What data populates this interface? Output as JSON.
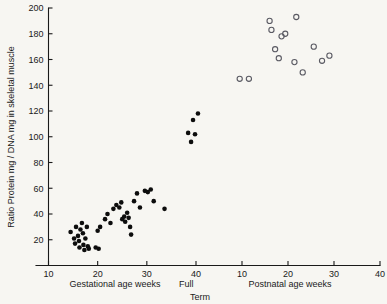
{
  "chart_data": {
    "type": "scatter",
    "title": "",
    "ylabel": "Ratio Protein mg / DNA mg in skeletal muscle",
    "ylim": [
      0,
      200
    ],
    "yticks": [
      20,
      40,
      60,
      80,
      100,
      120,
      140,
      160,
      180,
      200
    ],
    "grid": false,
    "legend": "none",
    "axis_break_label_line1": "Full",
    "axis_break_label_line2": "Term",
    "axes": [
      {
        "id": "gestational",
        "xlabel": "Gestational age weeks",
        "xlim": [
          10,
          40
        ],
        "xticks": [
          10,
          20,
          30,
          40
        ],
        "xtick_labels": [
          "10",
          "20",
          "30",
          "40"
        ]
      },
      {
        "id": "postnatal",
        "xlabel": "Postnatal age weeks",
        "xlim": [
          0,
          40
        ],
        "xticks": [
          10,
          20,
          30,
          40
        ],
        "xtick_labels": [
          "10",
          "20",
          "30",
          "40"
        ]
      }
    ],
    "series": [
      {
        "name": "Gestational age (fetal / preterm)",
        "axis": "gestational",
        "marker": "filled-circle",
        "color": "#0d0d0d",
        "points": [
          [
            14.5,
            26
          ],
          [
            15.2,
            21
          ],
          [
            15.4,
            17
          ],
          [
            15.6,
            30
          ],
          [
            16.0,
            23
          ],
          [
            16.2,
            19
          ],
          [
            16.3,
            14
          ],
          [
            16.5,
            28
          ],
          [
            16.8,
            33
          ],
          [
            17.0,
            25
          ],
          [
            17.1,
            16
          ],
          [
            17.3,
            12
          ],
          [
            17.5,
            21
          ],
          [
            17.8,
            30
          ],
          [
            18.0,
            15
          ],
          [
            18.2,
            13
          ],
          [
            19.6,
            14
          ],
          [
            20.0,
            27
          ],
          [
            20.2,
            13
          ],
          [
            20.5,
            30
          ],
          [
            21.5,
            36
          ],
          [
            22.0,
            40
          ],
          [
            22.6,
            33
          ],
          [
            23.2,
            44
          ],
          [
            23.8,
            47
          ],
          [
            24.4,
            45
          ],
          [
            24.8,
            49
          ],
          [
            25.0,
            36
          ],
          [
            25.4,
            38
          ],
          [
            25.6,
            34
          ],
          [
            26.0,
            41
          ],
          [
            26.3,
            37
          ],
          [
            26.6,
            30
          ],
          [
            26.8,
            24
          ],
          [
            27.4,
            50
          ],
          [
            28.0,
            56
          ],
          [
            28.6,
            45
          ],
          [
            29.6,
            58
          ],
          [
            30.2,
            57
          ],
          [
            30.8,
            59
          ],
          [
            31.4,
            50
          ],
          [
            33.6,
            44
          ],
          [
            38.4,
            103
          ],
          [
            39.0,
            96
          ],
          [
            39.4,
            113
          ],
          [
            39.8,
            102
          ],
          [
            40.4,
            118
          ]
        ]
      },
      {
        "name": "Postnatal age (infant / child)",
        "axis": "postnatal",
        "marker": "open-circle",
        "color": "#5a5a63",
        "points": [
          [
            9.5,
            145
          ],
          [
            11.5,
            145
          ],
          [
            16.0,
            190
          ],
          [
            16.4,
            183
          ],
          [
            18.6,
            178
          ],
          [
            19.4,
            180
          ],
          [
            17.2,
            168
          ],
          [
            18.0,
            161
          ],
          [
            21.8,
            193
          ],
          [
            21.4,
            158
          ],
          [
            23.2,
            150
          ],
          [
            25.6,
            170
          ],
          [
            27.4,
            159
          ],
          [
            29.0,
            163
          ]
        ]
      }
    ]
  }
}
